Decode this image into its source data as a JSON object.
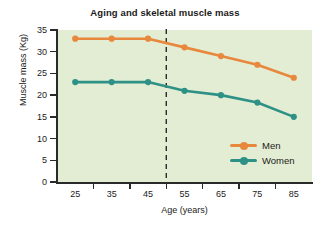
{
  "chart_data": {
    "type": "line",
    "title": "Aging and skeletal muscle mass",
    "xlabel": "Age (years)",
    "ylabel": "Muscle mass (Kg)",
    "x": [
      25,
      35,
      45,
      55,
      65,
      75,
      85
    ],
    "xtick_labels": [
      "25",
      "35",
      "45",
      "55",
      "65",
      "75",
      "85"
    ],
    "ytick_labels": [
      "0",
      "5",
      "10",
      "15",
      "20",
      "25",
      "30",
      "35"
    ],
    "yticks": [
      0,
      5,
      10,
      15,
      20,
      25,
      30,
      35
    ],
    "xlim": [
      20,
      90
    ],
    "ylim": [
      0,
      35
    ],
    "grid": false,
    "legend_position": "inside-bottom-right",
    "series": [
      {
        "name": "Men",
        "color": "#e8883c",
        "values": [
          33,
          33,
          33,
          31,
          29,
          27,
          24
        ]
      },
      {
        "name": "Women",
        "color": "#2e9186",
        "values": [
          23,
          23,
          23,
          21,
          20,
          18.3,
          15
        ]
      }
    ],
    "annotations": [
      {
        "type": "vertical-dashed-line",
        "x": 50,
        "color": "#2a2a2a"
      }
    ],
    "plot_background": "#e3edd3",
    "page_background": "#ffffff"
  }
}
